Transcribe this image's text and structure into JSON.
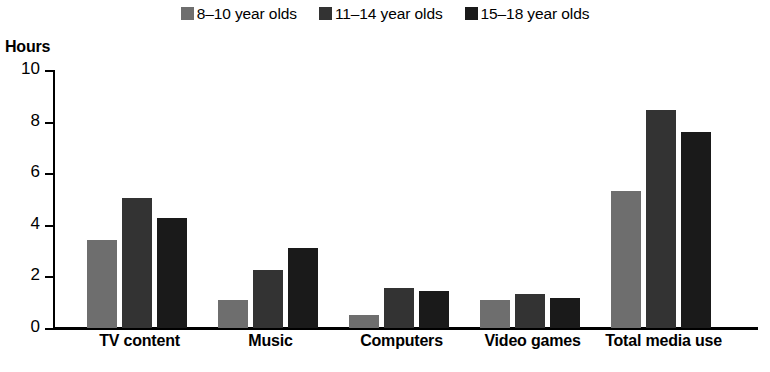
{
  "chart_data": {
    "type": "bar",
    "title": "",
    "xlabel": "",
    "ylabel": "Hours",
    "ylim": [
      0,
      10
    ],
    "yticks": [
      0,
      2,
      4,
      6,
      8,
      10
    ],
    "grid": false,
    "legend_position": "top-center",
    "categories": [
      "TV content",
      "Music",
      "Computers",
      "Video games",
      "Total media use"
    ],
    "series": [
      {
        "name": "8–10 year olds",
        "color": "#6e6e6e",
        "values": [
          3.4,
          1.1,
          0.5,
          1.1,
          5.3
        ]
      },
      {
        "name": "11–14 year olds",
        "color": "#333333",
        "values": [
          5.05,
          2.25,
          1.55,
          1.3,
          8.45
        ]
      },
      {
        "name": "15–18 year olds",
        "color": "#1a1a1a",
        "values": [
          4.25,
          3.1,
          1.45,
          1.15,
          7.6
        ]
      }
    ]
  },
  "legend": {
    "items": [
      {
        "label": "8–10 year olds",
        "color": "#6e6e6e",
        "swatch_name": "legend-swatch-8-10"
      },
      {
        "label": "11–14 year olds",
        "color": "#333333",
        "swatch_name": "legend-swatch-11-14"
      },
      {
        "label": "15–18 year olds",
        "color": "#1a1a1a",
        "swatch_name": "legend-swatch-15-18"
      }
    ]
  },
  "axis": {
    "y_title": "Hours",
    "y_tick_labels": [
      "10",
      "8",
      "6",
      "4",
      "2",
      "0"
    ],
    "x_labels": [
      "TV content",
      "Music",
      "Computers",
      "Video games",
      "Total media use"
    ]
  }
}
